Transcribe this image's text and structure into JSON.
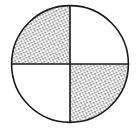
{
  "figure": {
    "name": "fraction-circle-diagram",
    "title": "Circle divided into four equal quadrants with two shaded",
    "background_color": "#ffffff",
    "line_color": "#1a1a1a",
    "shading_color": "#2b2b2b",
    "unshaded_color": "#ffffff",
    "shading_style": "stipple-dots",
    "circle": {
      "center_x": 70,
      "center_y": 64,
      "radius": 59,
      "stroke_width": 1.6
    },
    "divider_lines": [
      {
        "label": "vertical-divider",
        "x1": 70,
        "y1": 5,
        "x2": 70,
        "y2": 123
      },
      {
        "label": "horizontal-divider",
        "x1": 11,
        "y1": 64,
        "x2": 129,
        "y2": 64
      }
    ],
    "total_parts": 4,
    "shaded_parts": 2,
    "fraction": "2/4",
    "quadrants": [
      {
        "name": "top-left",
        "shaded": true
      },
      {
        "name": "top-right",
        "shaded": false
      },
      {
        "name": "bottom-left",
        "shaded": false
      },
      {
        "name": "bottom-right",
        "shaded": true
      }
    ]
  }
}
